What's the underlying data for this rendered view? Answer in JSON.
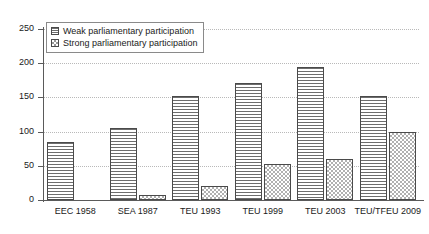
{
  "chart_data": {
    "type": "bar",
    "title": "",
    "subtitle": "",
    "xlabel": "",
    "ylabel": "",
    "categories": [
      "EEC 1958",
      "SEA 1987",
      "TEU 1993",
      "TEU 1999",
      "TEU 2003",
      "TEU/TFEU 2009"
    ],
    "series": [
      {
        "name": "Weak parliamentary participation",
        "pattern": "horizontal-lines",
        "values": [
          85,
          105,
          152,
          171,
          195,
          152
        ]
      },
      {
        "name": "Strong parliamentary participation",
        "pattern": "checkerboard",
        "values": [
          0,
          7,
          21,
          52,
          60,
          100
        ]
      }
    ],
    "ylim": [
      0,
      250
    ],
    "yticks": [
      0,
      50,
      100,
      150,
      200,
      250
    ],
    "ytick_labels": [
      "0",
      "50",
      "100",
      "150",
      "200",
      "250"
    ],
    "grid": true,
    "grid_style": "dotted-horizontal",
    "legend_position": "top-left-inside",
    "colors": {
      "axis": "#5a5a5a",
      "gridline": "#b9b9b9",
      "bar_outline": "#4a4a4a",
      "weak_fill": "#6d6d6d",
      "strong_fill": "#b0b0b0",
      "background": "#ffffff",
      "text": "#1a1a1a"
    }
  },
  "legend": {
    "items": [
      {
        "label": "Weak parliamentary participation",
        "swatch": "hlines-swatch-icon"
      },
      {
        "label": "Strong parliamentary participation",
        "swatch": "checker-swatch-icon"
      }
    ]
  }
}
